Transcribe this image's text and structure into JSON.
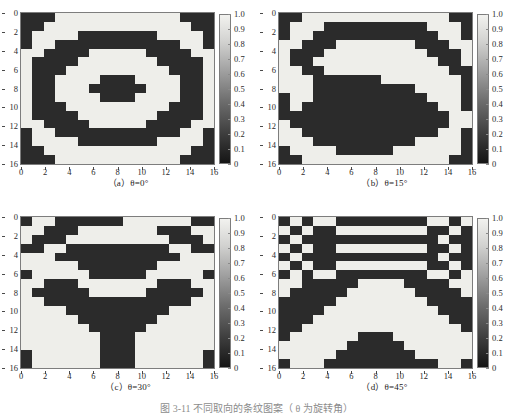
{
  "figure": {
    "main_caption": "图 3-11  不同取向的条纹图案（ θ 为旋转角）",
    "panels": [
      {
        "id": "a",
        "caption_prefix": "（a）",
        "caption_symbol": "θ",
        "caption_value": "=0°",
        "caption": "（a）θ=0°",
        "theta_deg": 0
      },
      {
        "id": "b",
        "caption_prefix": "（b）",
        "caption_symbol": "θ",
        "caption_value": "=15°",
        "caption": "（b）θ=15°",
        "theta_deg": 15
      },
      {
        "id": "c",
        "caption_prefix": "（c）",
        "caption_symbol": "θ",
        "caption_value": "=30°",
        "caption": "（c）θ=30°",
        "theta_deg": 30
      },
      {
        "id": "d",
        "caption_prefix": "（d）",
        "caption_symbol": "θ",
        "caption_value": "=45°",
        "caption": "（d）θ=45°",
        "theta_deg": 45
      }
    ]
  },
  "chart_data": [
    {
      "type": "heatmap",
      "panel": "a",
      "title": "（a）θ=0°",
      "xlabel": "",
      "ylabel": "",
      "xlim": [
        0,
        16
      ],
      "ylim": [
        16,
        0
      ],
      "xticks": [
        0,
        2,
        4,
        6,
        8,
        10,
        12,
        14,
        16
      ],
      "yticks": [
        0,
        2,
        4,
        6,
        8,
        10,
        12,
        14,
        16
      ],
      "xticklabels": [
        "0",
        "2",
        "4",
        "6",
        "8",
        "10",
        "12",
        "14",
        "16"
      ],
      "yticklabels": [
        "0",
        "2",
        "4",
        "6",
        "8",
        "10",
        "12",
        "14",
        "16"
      ],
      "grid": false,
      "colormap": "gray",
      "clim": [
        0,
        1
      ],
      "colorbar": {
        "position": "right",
        "ticks": [
          0,
          0.1,
          0.2,
          0.3,
          0.4,
          0.5,
          0.6,
          0.7,
          0.8,
          0.9,
          1.0
        ],
        "ticklabels": [
          "0",
          "0.1",
          "0.2",
          "0.3",
          "0.4",
          "0.5",
          "0.6",
          "0.7",
          "0.8",
          "0.9",
          "1.0"
        ],
        "min_label": "0",
        "max_label": "1.0"
      },
      "nrows": 17,
      "ncols": 17,
      "values_binary_rows": [
        "00011111111111000",
        "00111111111111100",
        "01111000000011110",
        "01100000000000110",
        "11000011111000011",
        "10000111111100001",
        "10001111111110001",
        "10011110001111001",
        "10011100000111001",
        "10011110001111001",
        "10001111111110001",
        "10000111111100001",
        "11000011111000011",
        "01100000000000110",
        "01111000000011110",
        "00111111111111100",
        "00011111111111000"
      ]
    },
    {
      "type": "heatmap",
      "panel": "b",
      "title": "（b）θ=15°",
      "xlabel": "",
      "ylabel": "",
      "xlim": [
        0,
        16
      ],
      "ylim": [
        16,
        0
      ],
      "xticks": [
        0,
        2,
        4,
        6,
        8,
        10,
        12,
        14,
        16
      ],
      "yticks": [
        0,
        2,
        4,
        6,
        8,
        10,
        12,
        14,
        16
      ],
      "xticklabels": [
        "0",
        "2",
        "4",
        "6",
        "8",
        "10",
        "12",
        "14",
        "16"
      ],
      "yticklabels": [
        "0",
        "2",
        "4",
        "6",
        "8",
        "10",
        "12",
        "14",
        "16"
      ],
      "grid": false,
      "colormap": "gray",
      "clim": [
        0,
        1
      ],
      "colorbar": {
        "position": "right",
        "ticks": [
          0,
          0.1,
          0.2,
          0.3,
          0.4,
          0.5,
          0.6,
          0.7,
          0.8,
          0.9,
          1.0
        ],
        "ticklabels": [
          "0",
          "0.1",
          "0.2",
          "0.3",
          "0.4",
          "0.5",
          "0.6",
          "0.7",
          "0.8",
          "0.9",
          "1.0"
        ],
        "min_label": "0",
        "max_label": "1.0"
      },
      "nrows": 17,
      "ncols": 17,
      "values_binary_rows": [
        "00111111111111100",
        "01110000000001110",
        "01100000000000110",
        "11000111111100011",
        "10001111111110001",
        "10011111111111001",
        "11001111111111100",
        "11100000011111110",
        "11100000000011110",
        "01100000000001110",
        "01000000000000110",
        "00000000000000011",
        "10000000000000011",
        "11000000000000110",
        "11100000000011110",
        "01111000001111110",
        "00111111111111100"
      ]
    },
    {
      "type": "heatmap",
      "panel": "c",
      "title": "（c）θ=30°",
      "xlabel": "",
      "ylabel": "",
      "xlim": [
        0,
        16
      ],
      "ylim": [
        16,
        0
      ],
      "xticks": [
        0,
        2,
        4,
        6,
        8,
        10,
        12,
        14,
        16
      ],
      "yticks": [
        0,
        2,
        4,
        6,
        8,
        10,
        12,
        14,
        16
      ],
      "xticklabels": [
        "0",
        "2",
        "4",
        "6",
        "8",
        "10",
        "12",
        "14",
        "16"
      ],
      "yticklabels": [
        "0",
        "2",
        "4",
        "6",
        "8",
        "10",
        "12",
        "14",
        "16"
      ],
      "grid": false,
      "colormap": "gray",
      "clim": [
        0,
        1
      ],
      "colorbar": {
        "position": "right",
        "ticks": [
          0,
          0.1,
          0.2,
          0.3,
          0.4,
          0.5,
          0.6,
          0.7,
          0.8,
          0.9,
          1.0
        ],
        "ticklabels": [
          "0",
          "0.1",
          "0.2",
          "0.3",
          "0.4",
          "0.5",
          "0.6",
          "0.7",
          "0.8",
          "0.9",
          "1.0"
        ],
        "min_label": "0",
        "max_label": "1.0"
      },
      "nrows": 17,
      "ncols": 17,
      "values_binary_rows": [
        "01100000011111100",
        "11000111111100011",
        "10001111111110001",
        "00110000000001100",
        "11100000000000111",
        "11111000000011111",
        "01111100000111110",
        "11000111111100011",
        "10000011111000001",
        "11000000000000011",
        "11110000000001111",
        "11111000000011111",
        "11111100000111111",
        "11111110001111111",
        "11111110001111111",
        "01111110001111110",
        "01111110001111110"
      ]
    },
    {
      "type": "heatmap",
      "panel": "d",
      "title": "（d）θ=45°",
      "xlabel": "",
      "ylabel": "",
      "xlim": [
        0,
        16
      ],
      "ylim": [
        16,
        0
      ],
      "xticks": [
        0,
        2,
        4,
        6,
        8,
        10,
        12,
        14,
        16
      ],
      "yticks": [
        0,
        2,
        4,
        6,
        8,
        10,
        12,
        14,
        16
      ],
      "xticklabels": [
        "0",
        "2",
        "4",
        "6",
        "8",
        "10",
        "12",
        "14",
        "16"
      ],
      "yticklabels": [
        "0",
        "2",
        "4",
        "6",
        "8",
        "10",
        "12",
        "14",
        "16"
      ],
      "grid": false,
      "colormap": "gray",
      "clim": [
        0,
        1
      ],
      "colorbar": {
        "position": "right",
        "ticks": [
          0,
          0.1,
          0.2,
          0.3,
          0.4,
          0.5,
          0.6,
          0.7,
          0.8,
          0.9,
          1.0
        ],
        "ticklabels": [
          "0",
          "0.1",
          "0.2",
          "0.3",
          "0.4",
          "0.5",
          "0.6",
          "0.7",
          "0.8",
          "0.9",
          "1.0"
        ],
        "min_label": "0",
        "max_label": "1.0"
      },
      "nrows": 17,
      "ncols": 17,
      "values_binary_rows": [
        "01011000000001101",
        "10100111111110010",
        "01000000000000100",
        "10100111111110010",
        "01000000000000100",
        "10100111111110010",
        "01011000000001101",
        "11000001111000011",
        "10000011111100001",
        "00000111111110000",
        "00001111111111000",
        "00011111111111100",
        "00111111111111110",
        "01111110001111111",
        "11111100000111111",
        "11111000000011111",
        "01110000000000110"
      ]
    }
  ]
}
